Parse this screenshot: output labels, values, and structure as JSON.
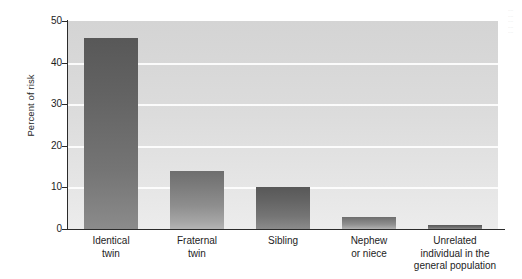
{
  "chart_data": {
    "type": "bar",
    "title": "",
    "xlabel": "",
    "ylabel": "Percent of risk",
    "ylim": [
      0,
      50
    ],
    "yticks": [
      0,
      10,
      20,
      30,
      40,
      50
    ],
    "ytick_labels": [
      "0",
      "10",
      "20",
      "30",
      "40",
      "50"
    ],
    "grid": "horizontal",
    "legend": "none",
    "categories": [
      "Identical\ntwin",
      "Fraternal\ntwin",
      "Sibling",
      "Nephew\nor niece",
      "Unrelated\nindividual in the\ngeneral population"
    ],
    "values": [
      46,
      14,
      10,
      3,
      1
    ],
    "bar_shades": [
      "dark",
      "light",
      "dark",
      "light",
      "dark"
    ]
  },
  "figure": {
    "y_axis_title": "Percent of risk"
  }
}
